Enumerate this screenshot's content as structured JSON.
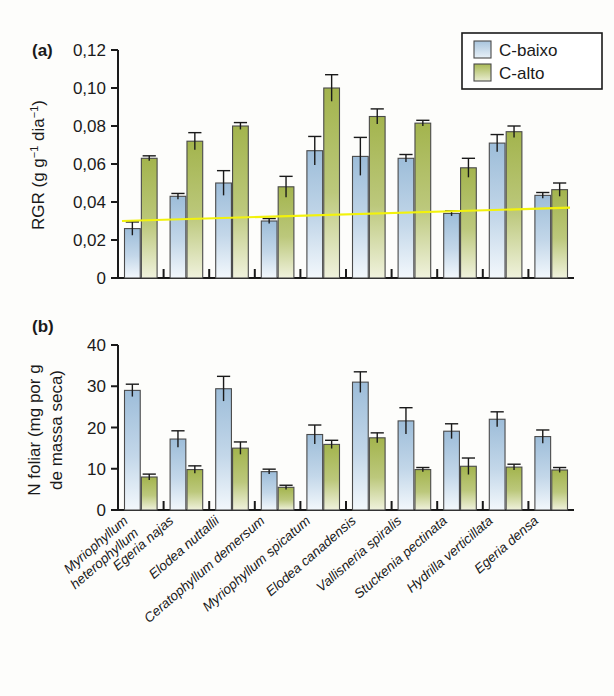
{
  "figure": {
    "background_color": "#fdfdfb",
    "legend": {
      "position": "top-right",
      "entries": [
        {
          "label": "C-baixo",
          "color": "#a8c4dd"
        },
        {
          "label": "C-alto",
          "color": "#a9b955"
        }
      ]
    },
    "panels": [
      {
        "tag": "(a)"
      },
      {
        "tag": "(b)"
      }
    ]
  },
  "colors": {
    "c_baixo": "#a8c4dd",
    "c_baixo_light": "#eef4fa",
    "c_alto": "#a9b955",
    "c_alto_light": "#eef0dc",
    "trendline": "#f2f20c",
    "axis": "#1a1a1a"
  },
  "species": [
    "Myriophyllum heterophyllum",
    "Egeria najas",
    "Elodea nuttallii",
    "Ceratophyllum demersum",
    "Myriophyllum spicatum",
    "Elodea canadensis",
    "Vallisneria spiralis",
    "Stuckenia pectinata",
    "Hydrilla verticillata",
    "Egeria densa"
  ],
  "species_lines": [
    [
      "Myriophyllum",
      "heterophyllum"
    ],
    [
      "Egeria najas",
      ""
    ],
    [
      "Elodea nuttallii",
      ""
    ],
    [
      "Ceratophyllum demersum",
      ""
    ],
    [
      "Myriophyllum spicatum",
      ""
    ],
    [
      "Elodea canadensis",
      ""
    ],
    [
      "Vallisneria spiralis",
      ""
    ],
    [
      "Stuckenia pectinata",
      ""
    ],
    [
      "Hydrilla verticillata",
      ""
    ],
    [
      "Egeria densa",
      ""
    ]
  ],
  "chart_data": [
    {
      "type": "bar",
      "panel": "(a)",
      "title": "",
      "xlabel": "",
      "ylabel": "RGR (g g⁻¹ dia⁻¹)",
      "ylim": [
        0,
        0.12
      ],
      "yticks": [
        0,
        0.02,
        0.04,
        0.06,
        0.08,
        0.1,
        0.12
      ],
      "ytick_labels": [
        "0",
        "0,02",
        "0,04",
        "0,06",
        "0,08",
        "0,10",
        "0,12"
      ],
      "grid": false,
      "categories": [
        "Myriophyllum heterophyllum",
        "Egeria najas",
        "Elodea nuttallii",
        "Ceratophyllum demersum",
        "Myriophyllum spicatum",
        "Elodea canadensis",
        "Vallisneria spiralis",
        "Stuckenia pectinata",
        "Hydrilla verticillata",
        "Egeria densa"
      ],
      "series": [
        {
          "name": "C-baixo",
          "color": "#a8c4dd",
          "values": [
            0.026,
            0.043,
            0.05,
            0.03,
            0.067,
            0.064,
            0.063,
            0.034,
            0.071,
            0.0435
          ],
          "errors": [
            0.0035,
            0.0015,
            0.0065,
            0.0013,
            0.0075,
            0.01,
            0.002,
            0.0013,
            0.0045,
            0.0015
          ]
        },
        {
          "name": "C-alto",
          "color": "#a9b955",
          "values": [
            0.063,
            0.072,
            0.08,
            0.048,
            0.1,
            0.085,
            0.0815,
            0.058,
            0.077,
            0.0465
          ],
          "errors": [
            0.0013,
            0.0045,
            0.0018,
            0.0055,
            0.007,
            0.004,
            0.0015,
            0.005,
            0.003,
            0.0035
          ]
        }
      ],
      "annotations": [
        {
          "type": "trendline",
          "color": "#f2f20c",
          "y_start": 0.03,
          "y_end": 0.037
        }
      ]
    },
    {
      "type": "bar",
      "panel": "(b)",
      "title": "",
      "xlabel": "",
      "ylabel": "N foliar (mg por g de massa seca)",
      "ylabel_lines": [
        "N foliar (mg por g",
        "de massa seca)"
      ],
      "ylim": [
        0,
        40
      ],
      "yticks": [
        0,
        10,
        20,
        30,
        40
      ],
      "ytick_labels": [
        "0",
        "10",
        "20",
        "30",
        "40"
      ],
      "grid": false,
      "categories": [
        "Myriophyllum heterophyllum",
        "Egeria najas",
        "Elodea nuttallii",
        "Ceratophyllum demersum",
        "Myriophyllum spicatum",
        "Elodea canadensis",
        "Vallisneria spiralis",
        "Stuckenia pectinata",
        "Hydrilla verticillata",
        "Egeria densa"
      ],
      "series": [
        {
          "name": "C-baixo",
          "color": "#a8c4dd",
          "values": [
            29.0,
            17.2,
            29.4,
            9.3,
            18.3,
            31.0,
            21.6,
            19.1,
            22.0,
            17.8
          ],
          "errors": [
            1.5,
            2.0,
            3.0,
            0.6,
            2.3,
            2.5,
            3.2,
            1.8,
            1.8,
            1.6
          ]
        },
        {
          "name": "C-alto",
          "color": "#a9b955",
          "values": [
            8.0,
            9.8,
            15.0,
            5.5,
            15.9,
            17.5,
            9.8,
            10.6,
            10.4,
            9.7
          ],
          "errors": [
            0.7,
            0.9,
            1.5,
            0.5,
            1.0,
            1.2,
            0.5,
            2.0,
            0.7,
            0.6
          ]
        }
      ]
    }
  ]
}
